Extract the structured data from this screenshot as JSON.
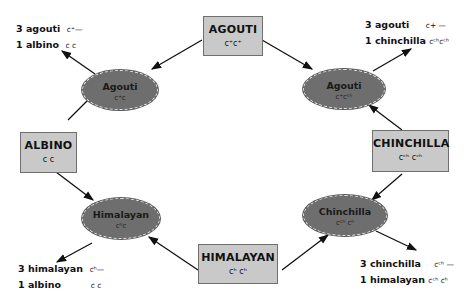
{
  "parents": {
    "agouti": {
      "name": "AGOUTI",
      "genotype": "c⁺c⁺"
    },
    "albino": {
      "name": "ALBINO",
      "genotype": "c c"
    },
    "chinchilla": {
      "name": "CHINCHILLA",
      "genotype": "cᶜʰ cᶜʰ"
    },
    "himalayan": {
      "name": "HIMALAYAN",
      "genotype": "cʰ cʰ"
    }
  },
  "hybrids": {
    "agouti_albino": {
      "name": "Agouti",
      "genotype": "c⁺c"
    },
    "agouti_chinchilla": {
      "name": "Agouti",
      "genotype": "c⁺cᶜʰ"
    },
    "himalayan_albino": {
      "name": "Himalayan",
      "genotype": "cʰc"
    },
    "chinchilla_himalayan": {
      "name": "Chinchilla",
      "genotype": "cᶜʰ cʰ"
    }
  },
  "results": {
    "top_left": [
      {
        "text": "3 agouti",
        "genotype": "c⁺—"
      },
      {
        "text": "1 albino",
        "genotype": "c  c"
      }
    ],
    "top_right": [
      {
        "text": "3 agouti",
        "genotype": "c+  —"
      },
      {
        "text": "1 chinchilla",
        "genotype": "cᶜʰcᶜʰ"
      }
    ],
    "bottom_left": [
      {
        "text": "3 himalayan",
        "genotype": "cʰ—"
      },
      {
        "text": "1 albino",
        "genotype": "c  c"
      }
    ],
    "bottom_right": [
      {
        "text": "3 chinchilla",
        "genotype": "cᶜʰ —"
      },
      {
        "text": "1 himalayan",
        "genotype": "cᶜʰ cʰ"
      }
    ]
  },
  "colors": {
    "box_fill": "#c9c9c9",
    "ellipse_fill": "#6e6e6e",
    "line": "#111111"
  }
}
